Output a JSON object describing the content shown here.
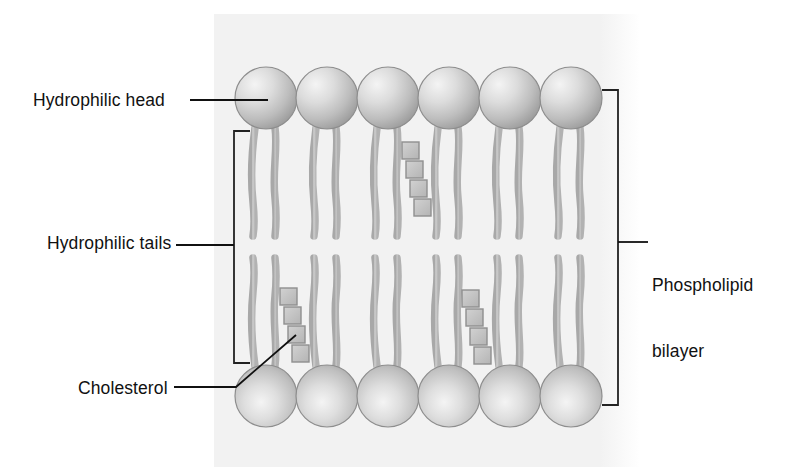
{
  "diagram": {
    "labels": {
      "hydrophilic_head": "Hydrophilic head",
      "hydrophilic_tails": "Hydrophilic tails",
      "cholesterol": "Cholesterol",
      "phospholipid_bilayer_line1": "Phospholipid",
      "phospholipid_bilayer_line2": "bilayer"
    },
    "structure": {
      "head_count_top_row": 6,
      "head_count_bottom_row": 6,
      "tails_per_head": 2,
      "cholesterol_clusters": 3,
      "squares_per_cholesterol": 4,
      "layers": 2
    },
    "colors": {
      "panel_background": "#f2f2f2",
      "page_background": "#ffffff",
      "head_fill_light": "#f0f0f0",
      "head_fill_mid": "#c8c8c8",
      "head_fill_dark": "#9a9a9a",
      "head_outline": "#8a8a8a",
      "tail_fill": "#c0c0c0",
      "tail_outline": "#9e9e9e",
      "cholesterol_fill": "#c4c4c4",
      "cholesterol_outline": "#8f8f8f",
      "leader_line": "#111111",
      "bracket": "#222222",
      "text": "#111111"
    }
  }
}
